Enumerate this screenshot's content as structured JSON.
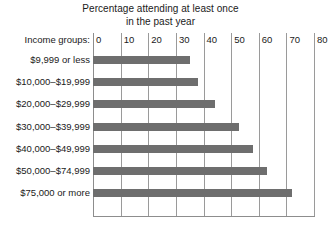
{
  "chart_data": {
    "type": "bar",
    "orientation": "horizontal",
    "title": "Percentage attending at least once in the past year",
    "title_lines": [
      "Percentage attending at least once",
      "in the past year"
    ],
    "category_axis_label": "Income groups:",
    "xlabel": "",
    "ylabel": "",
    "categories": [
      "$9,999 or less",
      "$10,000–$19,999",
      "$20,000–$29,999",
      "$30,000–$39,999",
      "$40,000–$49,999",
      "$50,000–$74,999",
      "$75,000 or more"
    ],
    "values": [
      35,
      38,
      44,
      53,
      58,
      63,
      72
    ],
    "xlim": [
      0,
      80
    ],
    "xticks": [
      0,
      10,
      20,
      30,
      40,
      50,
      60,
      70,
      80
    ],
    "xtick_labels": [
      "0",
      "10",
      "20",
      "30",
      "40",
      "50",
      "60",
      "70",
      "80"
    ],
    "grid": "vertical",
    "legend": "none",
    "bar_color": "#6e6e6e",
    "gridline_color": "#9a9a9a",
    "background_color": "#ffffff"
  }
}
